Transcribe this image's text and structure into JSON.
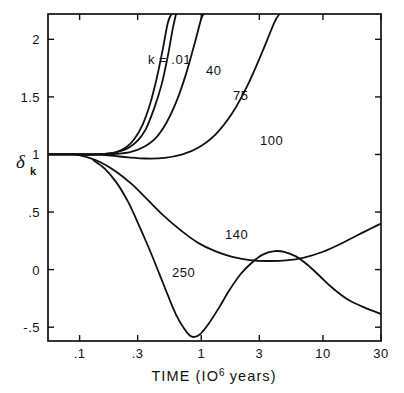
{
  "chart_data": {
    "type": "line",
    "title": "",
    "xlabel": "TIME (10⁶ years)",
    "xlabel_parts": {
      "prefix": "TIME (IO",
      "sup": "6",
      "suffix": " years)"
    },
    "ylabel": "δₖ",
    "ylabel_parts": {
      "symbol": "δ",
      "subscript": "k"
    },
    "xscale": "log",
    "yscale": "linear",
    "xlim": [
      0.055,
      30
    ],
    "ylim": [
      -0.62,
      2.22
    ],
    "grid": false,
    "legend": "inline-curve-labels",
    "xticks": [
      0.1,
      0.3,
      1,
      3,
      10,
      30
    ],
    "xticklabels": [
      ".1",
      ".3",
      "1",
      "3",
      "10",
      "30"
    ],
    "yticks": [
      2,
      1.5,
      1,
      0.5,
      0,
      -0.5
    ],
    "yticklabels": [
      "2",
      "1.5",
      "1",
      ".5",
      "0",
      "-.5"
    ],
    "annotations": [
      {
        "text": "k = .01",
        "x_px": 148,
        "y_px": 64
      },
      {
        "text": "40",
        "x_px": 206,
        "y_px": 75
      },
      {
        "text": "75",
        "x_px": 233,
        "y_px": 100
      },
      {
        "text": "100",
        "x_px": 260,
        "y_px": 145
      },
      {
        "text": "140",
        "x_px": 225,
        "y_px": 239
      },
      {
        "text": "250",
        "x_px": 172,
        "y_px": 277
      }
    ],
    "series": [
      {
        "name": "k = .01",
        "label": "k = .01",
        "points_xy": [
          [
            0.055,
            1.0
          ],
          [
            0.08,
            1.0
          ],
          [
            0.1,
            1.0
          ],
          [
            0.13,
            1.0
          ],
          [
            0.16,
            1.005
          ],
          [
            0.2,
            1.02
          ],
          [
            0.24,
            1.06
          ],
          [
            0.28,
            1.13
          ],
          [
            0.33,
            1.26
          ],
          [
            0.38,
            1.44
          ],
          [
            0.43,
            1.66
          ],
          [
            0.48,
            1.9
          ],
          [
            0.53,
            2.14
          ],
          [
            0.57,
            2.22
          ]
        ]
      },
      {
        "name": "40",
        "label": "40",
        "points_xy": [
          [
            0.055,
            1.0
          ],
          [
            0.08,
            1.0
          ],
          [
            0.1,
            1.0
          ],
          [
            0.13,
            1.0
          ],
          [
            0.16,
            1.004
          ],
          [
            0.2,
            1.018
          ],
          [
            0.25,
            1.055
          ],
          [
            0.3,
            1.12
          ],
          [
            0.35,
            1.22
          ],
          [
            0.41,
            1.4
          ],
          [
            0.47,
            1.6
          ],
          [
            0.53,
            1.85
          ],
          [
            0.58,
            2.08
          ],
          [
            0.62,
            2.22
          ]
        ]
      },
      {
        "name": "75",
        "label": "75",
        "points_xy": [
          [
            0.055,
            1.0
          ],
          [
            0.08,
            1.0
          ],
          [
            0.11,
            1.0
          ],
          [
            0.15,
            1.0
          ],
          [
            0.2,
            1.005
          ],
          [
            0.26,
            1.02
          ],
          [
            0.33,
            1.06
          ],
          [
            0.42,
            1.14
          ],
          [
            0.52,
            1.28
          ],
          [
            0.63,
            1.47
          ],
          [
            0.75,
            1.7
          ],
          [
            0.88,
            1.96
          ],
          [
            1.0,
            2.18
          ],
          [
            1.05,
            2.22
          ]
        ]
      },
      {
        "name": "100",
        "label": "100",
        "points_xy": [
          [
            0.055,
            1.0
          ],
          [
            0.09,
            1.0
          ],
          [
            0.13,
            0.998
          ],
          [
            0.18,
            0.99
          ],
          [
            0.25,
            0.975
          ],
          [
            0.35,
            0.965
          ],
          [
            0.5,
            0.97
          ],
          [
            0.7,
            1.0
          ],
          [
            0.95,
            1.06
          ],
          [
            1.3,
            1.17
          ],
          [
            1.8,
            1.36
          ],
          [
            2.4,
            1.6
          ],
          [
            3.2,
            1.9
          ],
          [
            4.0,
            2.15
          ],
          [
            4.4,
            2.22
          ]
        ]
      },
      {
        "name": "140",
        "label": "140",
        "points_xy": [
          [
            0.055,
            1.0
          ],
          [
            0.09,
            1.0
          ],
          [
            0.12,
            0.97
          ],
          [
            0.15,
            0.93
          ],
          [
            0.2,
            0.85
          ],
          [
            0.27,
            0.74
          ],
          [
            0.36,
            0.61
          ],
          [
            0.5,
            0.46
          ],
          [
            0.7,
            0.33
          ],
          [
            0.95,
            0.23
          ],
          [
            1.3,
            0.16
          ],
          [
            1.8,
            0.11
          ],
          [
            2.5,
            0.083
          ],
          [
            3.5,
            0.075
          ],
          [
            5.0,
            0.08
          ],
          [
            7.0,
            0.105
          ],
          [
            10,
            0.155
          ],
          [
            15,
            0.24
          ],
          [
            22,
            0.33
          ],
          [
            30,
            0.4
          ]
        ]
      },
      {
        "name": "250",
        "label": "250",
        "points_xy": [
          [
            0.13,
            0.95
          ],
          [
            0.16,
            0.88
          ],
          [
            0.2,
            0.76
          ],
          [
            0.25,
            0.59
          ],
          [
            0.3,
            0.41
          ],
          [
            0.37,
            0.19
          ],
          [
            0.45,
            -0.03
          ],
          [
            0.53,
            -0.22
          ],
          [
            0.62,
            -0.39
          ],
          [
            0.72,
            -0.51
          ],
          [
            0.8,
            -0.57
          ],
          [
            0.88,
            -0.585
          ],
          [
            0.98,
            -0.56
          ],
          [
            1.15,
            -0.47
          ],
          [
            1.4,
            -0.33
          ],
          [
            1.7,
            -0.18
          ],
          [
            2.1,
            -0.04
          ],
          [
            2.6,
            0.06
          ],
          [
            3.2,
            0.13
          ],
          [
            4.0,
            0.16
          ],
          [
            4.8,
            0.155
          ],
          [
            6.0,
            0.115
          ],
          [
            7.5,
            0.04
          ],
          [
            9.5,
            -0.06
          ],
          [
            12,
            -0.16
          ],
          [
            16,
            -0.26
          ],
          [
            22,
            -0.33
          ],
          [
            30,
            -0.385
          ]
        ]
      }
    ]
  }
}
